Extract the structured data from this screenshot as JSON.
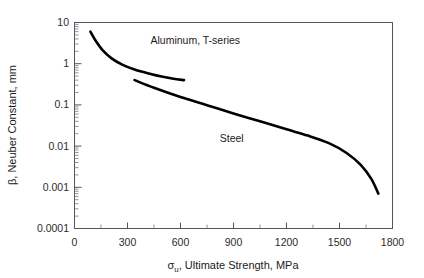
{
  "chart_data": {
    "type": "line",
    "title": "",
    "xlabel": "σu, Ultimate Strength, MPa",
    "xlabel_parts": {
      "symbol": "σ",
      "subscript": "u",
      "rest": ", Ultimate Strength, MPa"
    },
    "ylabel": "β, Neuber Constant, mm",
    "xlim": [
      0,
      1800
    ],
    "ylim": [
      0.0001,
      10
    ],
    "yscale": "log",
    "xscale": "linear",
    "grid": false,
    "legend_position": "inline-annotations",
    "xticks": [
      0,
      300,
      600,
      900,
      1200,
      1500,
      1800
    ],
    "xtick_labels": [
      "0",
      "300",
      "600",
      "900",
      "1200",
      "1500",
      "1800"
    ],
    "x_minor_ticks": [
      150,
      450,
      750,
      1050,
      1350,
      1650
    ],
    "yticks": [
      10,
      1,
      0.1,
      0.01,
      0.001,
      0.0001
    ],
    "ytick_labels": [
      "10",
      "1",
      "0.1",
      "0.01",
      "0.001",
      "0.0001"
    ],
    "series": [
      {
        "name": "Aluminum, T-series",
        "label": "Aluminum, T-series",
        "label_x": 430,
        "label_y": 3.0,
        "color": "#000000",
        "x": [
          90,
          120,
          160,
          210,
          270,
          340,
          420,
          500,
          560,
          620
        ],
        "y": [
          6.0,
          3.6,
          2.1,
          1.35,
          0.95,
          0.72,
          0.58,
          0.48,
          0.43,
          0.4
        ]
      },
      {
        "name": "Steel",
        "label": "Steel",
        "label_x": 890,
        "label_y": 0.0125,
        "color": "#000000",
        "x": [
          340,
          450,
          600,
          750,
          900,
          1050,
          1200,
          1320,
          1440,
          1540,
          1620,
          1680,
          1720
        ],
        "y": [
          0.4,
          0.26,
          0.155,
          0.098,
          0.062,
          0.04,
          0.0255,
          0.018,
          0.0118,
          0.0068,
          0.0035,
          0.0016,
          0.0007
        ]
      }
    ]
  },
  "annotations": {
    "aluminum_label": "Aluminum, T-series",
    "steel_label": "Steel"
  }
}
